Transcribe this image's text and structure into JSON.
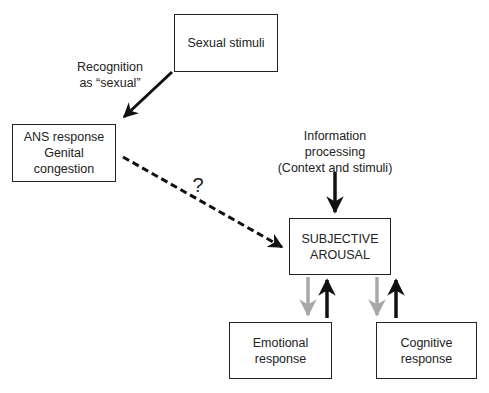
{
  "diagram": {
    "nodes": {
      "stimuli": {
        "lines": [
          "Sexual stimuli"
        ]
      },
      "ans": {
        "lines": [
          "ANS response",
          "Genital",
          "congestion"
        ]
      },
      "subjective": {
        "lines": [
          "SUBJECTIVE",
          "AROUSAL"
        ]
      },
      "emotional": {
        "lines": [
          "Emotional",
          "response"
        ]
      },
      "cognitive": {
        "lines": [
          "Cognitive",
          "response"
        ]
      }
    },
    "labels": {
      "recognition": {
        "lines": [
          "Recognition",
          "as “sexual”"
        ]
      },
      "info": {
        "lines": [
          "Information",
          "processing",
          "(Context and stimuli)"
        ]
      },
      "question": "?"
    },
    "edges": [
      {
        "from": "stimuli",
        "to": "ans",
        "style": "solid",
        "color": "#111111",
        "label": "recognition"
      },
      {
        "from": "ans",
        "to": "subjective",
        "style": "dashed",
        "color": "#111111",
        "label": "question"
      },
      {
        "from": "info",
        "to": "subjective",
        "style": "solid",
        "color": "#111111"
      },
      {
        "from": "subjective",
        "to": "emotional",
        "style": "solid",
        "color": "#a8a8a8"
      },
      {
        "from": "emotional",
        "to": "subjective",
        "style": "solid",
        "color": "#111111"
      },
      {
        "from": "subjective",
        "to": "cognitive",
        "style": "solid",
        "color": "#a8a8a8"
      },
      {
        "from": "cognitive",
        "to": "subjective",
        "style": "solid",
        "color": "#111111"
      }
    ]
  }
}
